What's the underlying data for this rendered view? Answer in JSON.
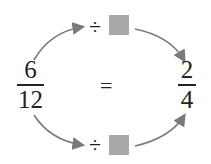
{
  "left_fraction": {
    "numerator": "6",
    "denominator": "12"
  },
  "right_fraction": {
    "numerator": "2",
    "denominator": "4"
  },
  "equals": "=",
  "top_operation": {
    "operator": "÷",
    "operand": "blank-box"
  },
  "bottom_operation": {
    "operator": "÷",
    "operand": "blank-box"
  },
  "colors": {
    "arrow": "#7a7a7a",
    "box": "#a9a9a9",
    "text": "#222222"
  }
}
